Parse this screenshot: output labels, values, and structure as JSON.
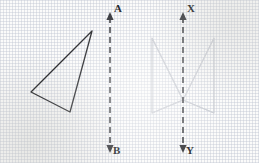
{
  "figure": {
    "background_color": "#fbfbfa",
    "grid": {
      "visible": true,
      "style": "dotted",
      "spacing_px": 25,
      "color": "#8c96af"
    },
    "labels": {
      "a": "A",
      "b": "B",
      "x": "X",
      "y": "Y"
    },
    "mirror_lines": [
      {
        "name": "line-ab",
        "top_label": "A",
        "bottom_label": "B",
        "x": 110,
        "y_top": 14,
        "y_bottom": 151,
        "style": "dashed",
        "color": "#2a2b30",
        "arrow_top": true,
        "arrow_bottom": true
      },
      {
        "name": "line-xy",
        "top_label": "X",
        "bottom_label": "Y",
        "x": 183,
        "y_top": 14,
        "y_bottom": 151,
        "style": "dashed",
        "color": "#2a2b30",
        "arrow_top": true,
        "arrow_bottom": true
      }
    ],
    "shapes": [
      {
        "name": "triangle-dark-left",
        "stroke": "#1a1b1f",
        "stroke_width": 1.3,
        "fill": "none",
        "points": "92,31 31,92 70,112"
      },
      {
        "name": "triangle-faint-left",
        "stroke": "#b9bcc4",
        "stroke_width": 1.1,
        "fill": "none",
        "points": "152,38 152,113 183,100"
      },
      {
        "name": "triangle-faint-right",
        "stroke": "#c3c6cd",
        "stroke_width": 1.1,
        "fill": "none",
        "points": "214,38 214,113 183,100"
      },
      {
        "name": "triangle-faint-left-inner",
        "stroke": "#c8cbd2",
        "stroke_width": 1.0,
        "fill": "none",
        "points": "152,38 183,100 214,113"
      },
      {
        "name": "triangle-faint-right-inner",
        "stroke": "#ccced5",
        "stroke_width": 1.0,
        "fill": "none",
        "points": "214,38 183,100 152,113"
      }
    ]
  }
}
